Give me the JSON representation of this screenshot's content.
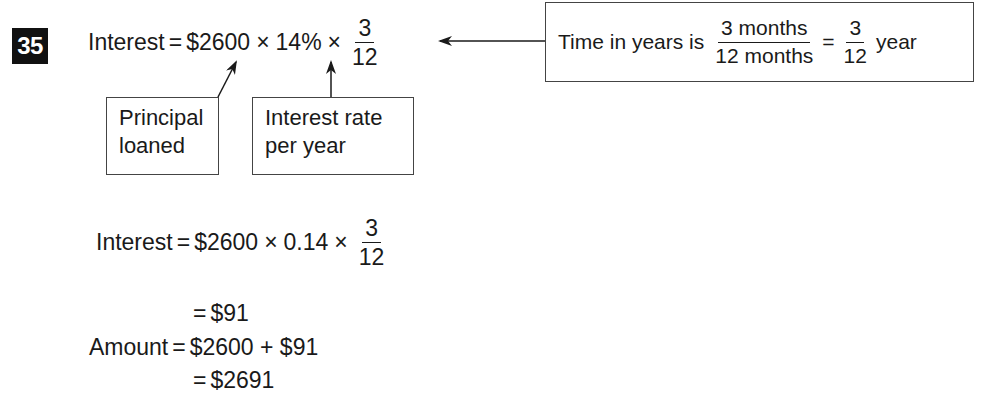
{
  "problem": {
    "number": "35",
    "main_equation": {
      "lhs": "Interest",
      "eq": "=",
      "principal": "$2600",
      "times1": "×",
      "rate": "14%",
      "times2": "×",
      "frac_num": "3",
      "frac_den": "12"
    },
    "time_note": {
      "prefix": "Time in years is",
      "frac1_num": "3 months",
      "frac1_den": "12 months",
      "eq": "=",
      "frac2_num": "3",
      "frac2_den": "12",
      "suffix": "year"
    },
    "labels": {
      "principal_line1": "Principal",
      "principal_line2": "loaned",
      "rate_line1": "Interest rate",
      "rate_line2": "per year"
    },
    "step2": {
      "lhs": "Interest",
      "eq": "=",
      "principal": "$2600",
      "times1": "×",
      "rate_decimal": "0.14",
      "times2": "×",
      "frac_num": "3",
      "frac_den": "12"
    },
    "step3": {
      "eq": "=",
      "value": "$91"
    },
    "step4": {
      "lhs": "Amount",
      "eq": "=",
      "expr": "$2600 + $91"
    },
    "step5": {
      "eq": "=",
      "value": "$2691"
    }
  }
}
